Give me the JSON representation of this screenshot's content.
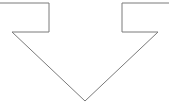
{
  "diagram": {
    "shape": "down-arrow-outline",
    "stroke_color": "#7a7a7a",
    "fill_color": "#ffffff",
    "background": "#ffffff",
    "points": [
      [
        0,
        3
      ],
      [
        49,
        3
      ],
      [
        49,
        32
      ],
      [
        12,
        32
      ],
      [
        85,
        101
      ],
      [
        158,
        32
      ],
      [
        122,
        32
      ],
      [
        122,
        3
      ],
      [
        169,
        3
      ]
    ]
  }
}
